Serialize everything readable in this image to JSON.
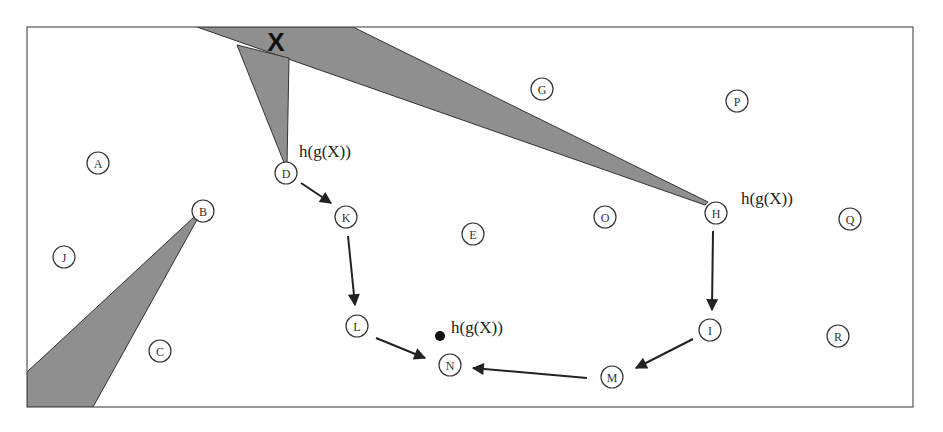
{
  "diagram": {
    "type": "state-space trajectory diagram",
    "region_label": "X",
    "annotation_text": "h(g(X))",
    "colors": {
      "region_fill": "#8f8f8f",
      "stroke": "#333333",
      "background": "#ffffff"
    },
    "nodes": [
      {
        "id": "A",
        "label": "A",
        "x": 98,
        "y": 163
      },
      {
        "id": "B",
        "label": "B",
        "x": 203,
        "y": 211
      },
      {
        "id": "C",
        "label": "C",
        "x": 160,
        "y": 351
      },
      {
        "id": "D",
        "label": "D",
        "x": 286,
        "y": 173
      },
      {
        "id": "E",
        "label": "E",
        "x": 473,
        "y": 234
      },
      {
        "id": "G",
        "label": "G",
        "x": 542,
        "y": 89
      },
      {
        "id": "H",
        "label": "H",
        "x": 716,
        "y": 213
      },
      {
        "id": "I",
        "label": "I",
        "x": 710,
        "y": 330
      },
      {
        "id": "J",
        "label": "J",
        "x": 64,
        "y": 257
      },
      {
        "id": "K",
        "label": "K",
        "x": 346,
        "y": 217
      },
      {
        "id": "L",
        "label": "L",
        "x": 357,
        "y": 326
      },
      {
        "id": "M",
        "label": "M",
        "x": 612,
        "y": 377
      },
      {
        "id": "N",
        "label": "N",
        "x": 450,
        "y": 365
      },
      {
        "id": "O",
        "label": "O",
        "x": 605,
        "y": 217
      },
      {
        "id": "P",
        "label": "P",
        "x": 737,
        "y": 101
      },
      {
        "id": "Q",
        "label": "Q",
        "x": 850,
        "y": 219
      },
      {
        "id": "R",
        "label": "R",
        "x": 838,
        "y": 336
      }
    ],
    "edges": [
      {
        "from": "D",
        "to": "K"
      },
      {
        "from": "K",
        "to": "L"
      },
      {
        "from": "L",
        "to": "N"
      },
      {
        "from": "H",
        "to": "I"
      },
      {
        "from": "I",
        "to": "M"
      },
      {
        "from": "M",
        "to": "N"
      }
    ],
    "annotations": [
      {
        "id": "annot-d",
        "text": "h(g(X))",
        "x": 299,
        "y": 157,
        "anchor_node": "D"
      },
      {
        "id": "annot-h",
        "text": "h(g(X))",
        "x": 741,
        "y": 204,
        "anchor_node": "H"
      },
      {
        "id": "annot-dot",
        "text": "h(g(X))",
        "x": 451,
        "y": 333,
        "anchor_node": "point"
      }
    ],
    "point": {
      "x": 440,
      "y": 336
    }
  }
}
